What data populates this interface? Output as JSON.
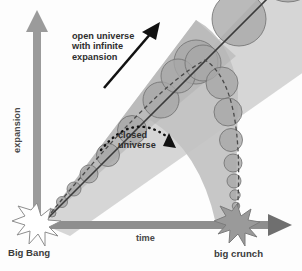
{
  "figure": {
    "kind": "cosmology-diagram",
    "background_color": "#fdfdfd"
  },
  "axes": {
    "y": {
      "label": "expansion",
      "arrow_direction": "up",
      "color": "#9b9b9b"
    },
    "x": {
      "label": "time",
      "arrow_direction": "right",
      "color": "#8e8e8e"
    },
    "origin_label": "Big Bang",
    "end_label": "big crunch"
  },
  "annotations": {
    "open_universe": {
      "line1": "open universe",
      "line2": "with infinite",
      "line3": "expansion",
      "arrow": "solid-straight-arrow-up-right",
      "arrow_color": "#111111"
    },
    "closed_universe": {
      "line1": "closed",
      "line2": "universe",
      "arrow": "dotted-arc-arrow-down-right",
      "arrow_color": "#111111"
    }
  },
  "events": [
    {
      "name": "Big Bang",
      "icon": "starburst-icon",
      "fill": "#ffffff",
      "stroke": "#8e8e8e"
    },
    {
      "name": "big crunch",
      "icon": "starburst-icon",
      "fill": "#9a9a9a",
      "stroke": "#7a7a7a"
    }
  ],
  "cones": [
    {
      "name": "open-universe-cone",
      "description": "widening cone rising from Big Bang to upper right, exits frame",
      "fill": "#cfcfcf",
      "band_fill": "#b3b3b3"
    },
    {
      "name": "closed-universe-cone",
      "description": "cone rising from Big Bang then narrowing down to big crunch",
      "fill": "#bdbdbd"
    }
  ],
  "spheres": {
    "name": "universe-spheres",
    "description": "circles of increasing then decreasing radius marking scale of the universe",
    "fill": "#a8a8a8",
    "stroke": "#6f6f6f"
  },
  "colors": {
    "axis_gray": "#9b9b9b",
    "cone_light": "#d2d2d2",
    "cone_mid": "#bdbdbd",
    "cone_dark": "#a5a5a5",
    "text": "#2e2e2e",
    "arrow_black": "#111111"
  }
}
